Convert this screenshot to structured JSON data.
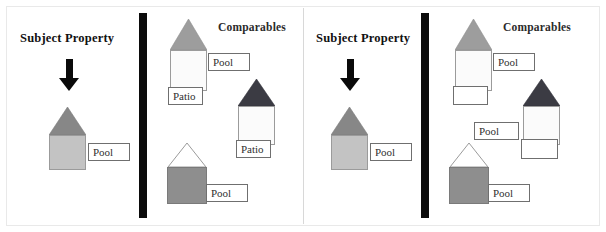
{
  "figure": {
    "type": "real-estate-comparables-diagram",
    "width": 606,
    "height": 232,
    "background": "#ffffff",
    "divider_color": "#0b0b0b",
    "panel_separator_color": "#d8d8d8"
  },
  "panels": [
    {
      "id": "panel-left",
      "subject": {
        "title": "Subject Property",
        "arrow": "down-arrow",
        "house": {
          "roof_style": "filled",
          "roof_color": "#878787",
          "body_color": "#c3c3c3",
          "body_border": "#9b9b9b"
        },
        "labels": [
          {
            "text": "Pool"
          }
        ]
      },
      "comparables": {
        "title": "Comparables",
        "houses": [
          {
            "id": "comp-1",
            "roof_style": "filled",
            "roof_color": "#9d9d9d",
            "body_color": "#fbfbfb",
            "body_border": "#9b9b9b",
            "labels": [
              {
                "text": "Pool"
              },
              {
                "text": "Patio"
              }
            ]
          },
          {
            "id": "comp-2",
            "roof_style": "filled",
            "roof_color": "#3b3b43",
            "body_color": "#fbfbfb",
            "body_border": "#9b9b9b",
            "labels": [
              {
                "text": "Patio"
              }
            ]
          },
          {
            "id": "comp-3",
            "roof_style": "outline",
            "roof_color": "#ffffff",
            "body_color": "#8e8e8e",
            "body_border": "#7a7a7a",
            "labels": [
              {
                "text": "Pool"
              }
            ]
          }
        ]
      }
    },
    {
      "id": "panel-right",
      "subject": {
        "title": "Subject Property",
        "arrow": "down-arrow",
        "house": {
          "roof_style": "filled",
          "roof_color": "#878787",
          "body_color": "#c3c3c3",
          "body_border": "#9b9b9b"
        },
        "labels": [
          {
            "text": "Pool"
          }
        ]
      },
      "comparables": {
        "title": "Comparables",
        "houses": [
          {
            "id": "comp-1",
            "roof_style": "filled",
            "roof_color": "#9d9d9d",
            "body_color": "#fbfbfb",
            "body_border": "#9b9b9b",
            "labels": [
              {
                "text": "Pool"
              },
              {
                "text": ""
              }
            ]
          },
          {
            "id": "comp-2",
            "roof_style": "filled",
            "roof_color": "#3b3b43",
            "body_color": "#fbfbfb",
            "body_border": "#9b9b9b",
            "labels": [
              {
                "text": "Pool"
              },
              {
                "text": ""
              }
            ]
          },
          {
            "id": "comp-3",
            "roof_style": "outline",
            "roof_color": "#ffffff",
            "body_color": "#8e8e8e",
            "body_border": "#7a7a7a",
            "labels": [
              {
                "text": "Pool"
              }
            ]
          }
        ]
      }
    }
  ]
}
